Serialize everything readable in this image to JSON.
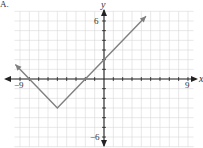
{
  "chart_data": {
    "type": "line",
    "title": "",
    "function": "y = |x + 5| - 3",
    "xlabel": "x",
    "ylabel": "y",
    "xlim": [
      -9,
      9
    ],
    "ylim": [
      -6,
      6
    ],
    "grid": true,
    "tick_labels": {
      "x_min": "−9",
      "x_max": "9",
      "y_max": "6",
      "y_min": "−6"
    },
    "series": [
      {
        "name": "absolute value graph",
        "x": [
          -9.5,
          -8,
          -5,
          -2,
          0,
          4.5
        ],
        "y": [
          1.5,
          0,
          -3,
          0,
          2,
          6.5
        ]
      }
    ],
    "vertex": [
      -5,
      -3
    ],
    "color": "#808080"
  },
  "labels": {
    "corner": "A.",
    "x_min": "−9",
    "x_max": "9",
    "y_max": "6",
    "y_min": "−6",
    "y_axis": "y",
    "x_axis": "x"
  }
}
